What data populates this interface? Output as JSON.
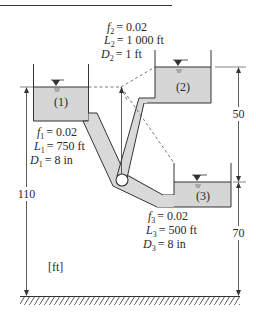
{
  "colors": {
    "water": "#d6d6d6",
    "line": "#333333",
    "pipe_fill": "#d9d9d9",
    "background": "#ffffff"
  },
  "units_label": "[ft]",
  "reservoirs": [
    {
      "id": "1",
      "label": "(1)"
    },
    {
      "id": "2",
      "label": "(2)"
    },
    {
      "id": "3",
      "label": "(3)"
    }
  ],
  "pipes": {
    "pipe1": {
      "f_sym": "f",
      "f_sub": "1",
      "f_val": "= 0.02",
      "L_sym": "L",
      "L_sub": "1",
      "L_val": "= 750 ft",
      "D_sym": "D",
      "D_sub": "1",
      "D_val": "= 8 in"
    },
    "pipe2": {
      "f_sym": "f",
      "f_sub": "2",
      "f_val": "= 0.02",
      "L_sym": "L",
      "L_sub": "2",
      "L_val": "= 1 000 ft",
      "D_sym": "D",
      "D_sub": "2",
      "D_val": "= 1 ft"
    },
    "pipe3": {
      "f_sym": "f",
      "f_sub": "3",
      "f_val": "= 0.02",
      "L_sym": "L",
      "L_sub": "3",
      "L_val": "= 500 ft",
      "D_sym": "D",
      "D_sub": "3",
      "D_val": "= 8 in"
    }
  },
  "dimensions": {
    "elev_reservoir1": "110",
    "diff_2_to_3": "50",
    "elev_reservoir3": "70"
  }
}
